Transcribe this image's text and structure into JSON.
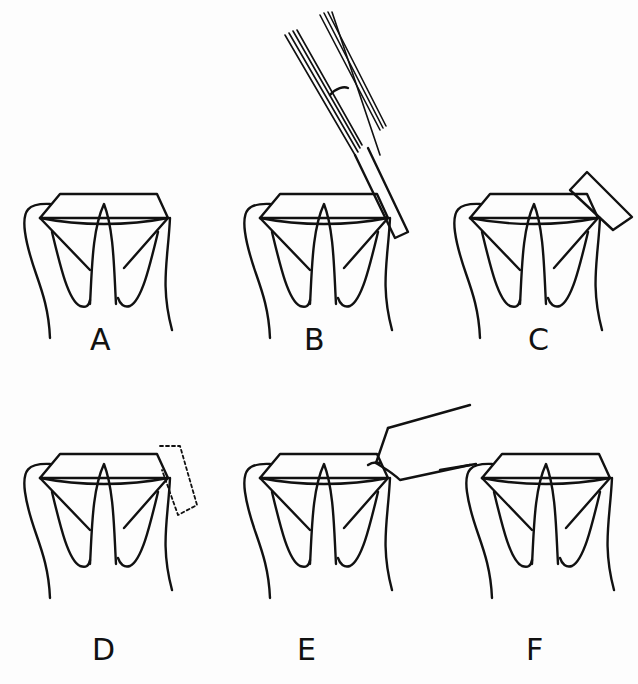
{
  "figure": {
    "panels": [
      {
        "id": "A",
        "label": "A",
        "tool": "none"
      },
      {
        "id": "B",
        "label": "B",
        "tool": "forceps-with-bar"
      },
      {
        "id": "C",
        "label": "C",
        "tool": "block"
      },
      {
        "id": "D",
        "label": "D",
        "tool": "dotted-block-outline"
      },
      {
        "id": "E",
        "label": "E",
        "tool": "angled-instrument"
      },
      {
        "id": "F",
        "label": "F",
        "tool": "none"
      }
    ]
  }
}
